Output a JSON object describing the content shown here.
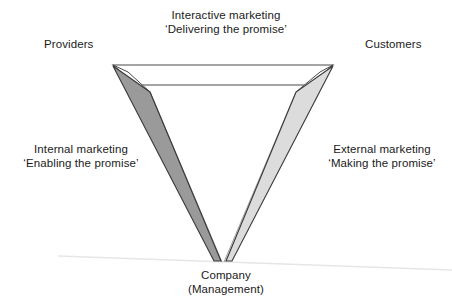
{
  "diagram": {
    "title_implicit": "Services marketing triangle",
    "labels": {
      "interactive": {
        "line1": "Interactive marketing",
        "line2": "‘Delivering the promise’"
      },
      "providers": "Providers",
      "customers": "Customers",
      "internal": {
        "line1": "Internal marketing",
        "line2": "‘Enabling the promise’"
      },
      "external": {
        "line1": "External marketing",
        "line2": "‘Making the promise’"
      },
      "company": {
        "line1": "Company",
        "line2": "(Management)"
      }
    },
    "colors": {
      "outline": "#3a3a3a",
      "left_arm_fill": "#9a9a9a",
      "right_arm_fill": "#dcdcdc",
      "top_band_fill": "#ffffff",
      "text": "#1a1a1a",
      "ground_line": "#e2e2e2",
      "background": "#ffffff"
    },
    "geometry": {
      "top_left_outer": [
        113,
        65
      ],
      "top_right_outer": [
        333,
        65
      ],
      "top_left_inner": [
        136,
        85
      ],
      "top_right_inner": [
        310,
        85
      ],
      "bottom_vertex": [
        222,
        262
      ],
      "left_arm_top_inner": [
        150,
        92
      ],
      "right_arm_top_inner": [
        296,
        92
      ]
    }
  }
}
